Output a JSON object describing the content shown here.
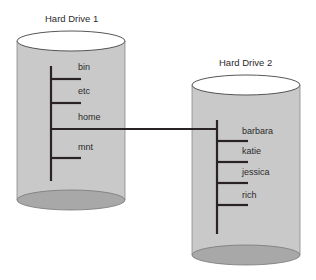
{
  "diagram": {
    "drives": [
      {
        "title": "Hard Drive 1",
        "directories": [
          "bin",
          "etc",
          "home",
          "mnt"
        ]
      },
      {
        "title": "Hard Drive 2",
        "directories": [
          "barbara",
          "katie",
          "jessica",
          "rich"
        ]
      }
    ],
    "mount_link": {
      "from": "home",
      "to": "Hard Drive 2"
    },
    "colors": {
      "cylinder_body": "#c9c9c9",
      "cylinder_top": "#ffffff",
      "cylinder_bottom": "#a8a8a8",
      "line": "#2a2226"
    }
  }
}
